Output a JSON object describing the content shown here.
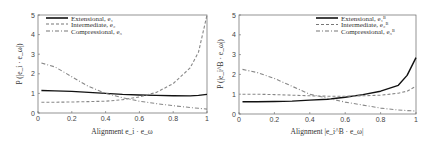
{
  "chart_data": [
    {
      "type": "line",
      "title": "",
      "xlabel": "Alignment e_i · e_ω",
      "ylabel": "P(|e_i · e_ω|)",
      "xlim": [
        0,
        1
      ],
      "ylim": [
        0,
        5
      ],
      "xticks": [
        "0",
        "0.2",
        "0.4",
        "0.6",
        "0.8",
        "1"
      ],
      "yticks": [
        "0",
        "1",
        "2",
        "3",
        "4",
        "5"
      ],
      "grid": false,
      "legend_position": "upper left",
      "x": [
        0.02,
        0.1,
        0.2,
        0.3,
        0.4,
        0.5,
        0.6,
        0.7,
        0.8,
        0.9,
        0.95,
        1.0
      ],
      "series": [
        {
          "name": "Extensional, e1",
          "style": "solid",
          "values": [
            1.15,
            1.13,
            1.1,
            1.05,
            1.0,
            0.95,
            0.92,
            0.9,
            0.88,
            0.87,
            0.9,
            0.95
          ]
        },
        {
          "name": "Intermediate, e2",
          "style": "dashed",
          "values": [
            0.55,
            0.55,
            0.56,
            0.58,
            0.6,
            0.68,
            0.82,
            1.05,
            1.5,
            2.3,
            3.1,
            5.0
          ]
        },
        {
          "name": "Compressional, e3",
          "style": "dash-dot",
          "values": [
            2.55,
            2.35,
            1.85,
            1.35,
            1.0,
            0.78,
            0.6,
            0.48,
            0.37,
            0.28,
            0.24,
            0.2
          ]
        }
      ]
    },
    {
      "type": "line",
      "title": "",
      "xlabel": "Alignment |e_i^B · e_ω|",
      "ylabel": "P(|e_i^B · e_ω|)",
      "xlim": [
        0,
        1
      ],
      "ylim": [
        0,
        5
      ],
      "xticks": [
        "0",
        "0.2",
        "0.4",
        "0.6",
        "0.8",
        "1"
      ],
      "yticks": [
        "0",
        "1",
        "2",
        "3",
        "4",
        "5"
      ],
      "grid": false,
      "legend_position": "upper right",
      "x": [
        0.02,
        0.1,
        0.2,
        0.3,
        0.4,
        0.5,
        0.6,
        0.7,
        0.8,
        0.9,
        0.95,
        1.0
      ],
      "series": [
        {
          "name": "Extensional, e1^B",
          "style": "solid",
          "values": [
            0.62,
            0.62,
            0.63,
            0.65,
            0.7,
            0.75,
            0.85,
            0.98,
            1.15,
            1.45,
            1.95,
            2.85
          ]
        },
        {
          "name": "Intermediate, e2^B",
          "style": "dashed",
          "values": [
            1.0,
            1.0,
            0.98,
            0.95,
            0.92,
            0.9,
            0.9,
            0.92,
            0.95,
            1.05,
            1.15,
            1.4
          ]
        },
        {
          "name": "Compressional, e3^B",
          "style": "dash-dot",
          "values": [
            2.25,
            2.1,
            1.8,
            1.4,
            1.0,
            0.8,
            0.6,
            0.45,
            0.3,
            0.2,
            0.17,
            0.15
          ]
        }
      ]
    }
  ],
  "left": {
    "ylabel": "P (|e_i · e_ω|)",
    "xlabel": "Alignment e_i · e_ω",
    "legend": [
      "Extensional, e₁",
      "Intermediate, e₂",
      "Compressional, e₃"
    ]
  },
  "right": {
    "ylabel": "P (|e_i^B · e_ω|)",
    "xlabel": "Alignment |e_i^B · e_ω|",
    "legend": [
      "Extensional, e₁ᴮ",
      "Intermediate, e₂ᴮ",
      "Compressional, e₃ᴮ"
    ]
  }
}
